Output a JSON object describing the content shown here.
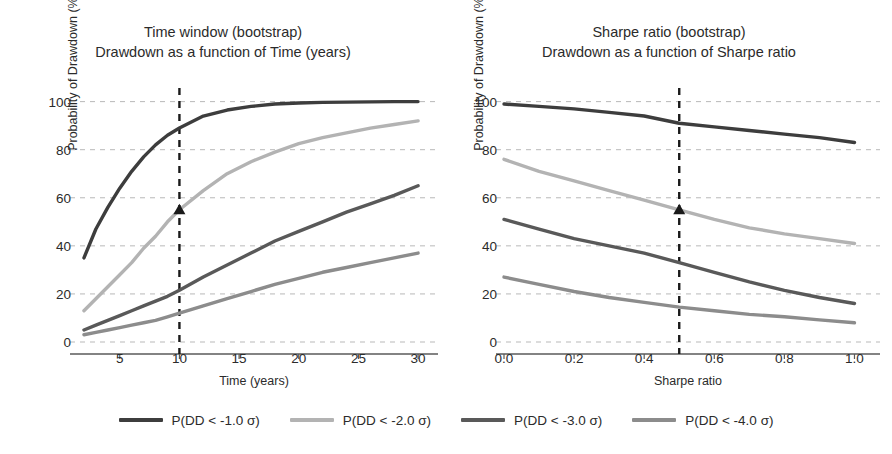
{
  "figure": {
    "width": 892,
    "height": 454,
    "background": "#ffffff"
  },
  "series_colors": [
    "#3d3d3d",
    "#b3b3b3",
    "#595959",
    "#8c8c8c"
  ],
  "legend": {
    "position": "bottom",
    "items": [
      {
        "label": "P(DD < -1.0 σ)",
        "color": "#3d3d3d"
      },
      {
        "label": "P(DD < -2.0 σ)",
        "color": "#b3b3b3"
      },
      {
        "label": "P(DD < -3.0 σ)",
        "color": "#595959"
      },
      {
        "label": "P(DD < -4.0 σ)",
        "color": "#8c8c8c"
      }
    ]
  },
  "panels": {
    "left": {
      "title": "Time window (bootstrap)",
      "subtitle": "Drawdown as a function of Time (years)",
      "xlabel": "Time (years)",
      "ylabel": "Probability of Drawdown (%)",
      "xticks": [
        "5",
        "10",
        "15",
        "20",
        "25",
        "30"
      ],
      "yticks": [
        "0",
        "20",
        "40",
        "60",
        "80",
        "100"
      ],
      "marker_annotation": {
        "x": "10",
        "y": "55"
      }
    },
    "right": {
      "title": "Sharpe ratio (bootstrap)",
      "subtitle": "Drawdown as a function of Sharpe ratio",
      "xlabel": "Sharpe ratio",
      "ylabel": "Probability of Drawdown (%)",
      "xticks": [
        "0.0",
        "0.2",
        "0.4",
        "0.6",
        "0.8",
        "1.0"
      ],
      "yticks": [
        "0",
        "20",
        "40",
        "60",
        "80",
        "100"
      ],
      "marker_annotation": {
        "x": "0.5",
        "y": "55"
      }
    }
  },
  "chart_data": [
    {
      "type": "line",
      "panel": "left",
      "title": "Time window (bootstrap)",
      "subtitle": "Drawdown as a function of Time (years)",
      "xlabel": "Time (years)",
      "ylabel": "Probability of Drawdown (%)",
      "xlim": [
        1.5,
        31
      ],
      "ylim": [
        0,
        104
      ],
      "xticks": [
        5,
        10,
        15,
        20,
        25,
        30
      ],
      "yticks": [
        0,
        20,
        40,
        60,
        80,
        100
      ],
      "grid": true,
      "grid_style": "dashed-horizontal",
      "vline": {
        "x": 10,
        "style": "dashed",
        "color": "#1a1a1a"
      },
      "marker": {
        "x": 10,
        "y": 55,
        "shape": "triangle",
        "color": "#1a1a1a",
        "series": "P(DD < -2.0 σ)"
      },
      "x": [
        2,
        3,
        4,
        5,
        6,
        7,
        8,
        9,
        10,
        12,
        14,
        16,
        18,
        20,
        22,
        24,
        26,
        28,
        30
      ],
      "series": [
        {
          "name": "P(DD < -1.0 σ)",
          "color": "#3d3d3d",
          "values": [
            35,
            47,
            56,
            64,
            71,
            77,
            82,
            86,
            89,
            94,
            96.5,
            98,
            99,
            99.4,
            99.7,
            99.8,
            99.9,
            100,
            100
          ]
        },
        {
          "name": "P(DD < -2.0 σ)",
          "color": "#b3b3b3",
          "values": [
            13,
            18,
            23,
            28,
            33,
            39,
            44,
            50,
            55,
            63,
            70,
            75,
            79,
            82.5,
            85,
            87,
            89,
            90.5,
            92
          ]
        },
        {
          "name": "P(DD < -3.0 σ)",
          "color": "#595959",
          "values": [
            5,
            7,
            9,
            11,
            13,
            15,
            17,
            19,
            21.5,
            27,
            32,
            37,
            42,
            46,
            50,
            54,
            57.5,
            61,
            65
          ]
        },
        {
          "name": "P(DD < -4.0 σ)",
          "color": "#8c8c8c",
          "values": [
            3,
            4,
            5,
            6,
            7,
            8,
            9,
            10.5,
            12,
            15,
            18,
            21,
            24,
            26.5,
            29,
            31,
            33,
            35,
            37
          ]
        }
      ]
    },
    {
      "type": "line",
      "panel": "right",
      "title": "Sharpe ratio (bootstrap)",
      "subtitle": "Drawdown as a function of Sharpe ratio",
      "xlabel": "Sharpe ratio",
      "ylabel": "Probability of Drawdown (%)",
      "xlim": [
        0,
        1.05
      ],
      "ylim": [
        0,
        104
      ],
      "xticks": [
        0.0,
        0.2,
        0.4,
        0.6,
        0.8,
        1.0
      ],
      "yticks": [
        0,
        20,
        40,
        60,
        80,
        100
      ],
      "grid": true,
      "grid_style": "dashed-horizontal",
      "vline": {
        "x": 0.5,
        "style": "dashed",
        "color": "#1a1a1a"
      },
      "marker": {
        "x": 0.5,
        "y": 55,
        "shape": "triangle",
        "color": "#1a1a1a",
        "series": "P(DD < -2.0 σ)"
      },
      "x": [
        0.0,
        0.1,
        0.2,
        0.3,
        0.4,
        0.5,
        0.6,
        0.7,
        0.8,
        0.9,
        1.0
      ],
      "series": [
        {
          "name": "P(DD < -1.0 σ)",
          "color": "#3d3d3d",
          "values": [
            99,
            98,
            97,
            95.5,
            94,
            91,
            89.5,
            88,
            86.5,
            85,
            83
          ]
        },
        {
          "name": "P(DD < -2.0 σ)",
          "color": "#b3b3b3",
          "values": [
            76,
            71,
            67,
            63,
            59,
            55,
            51,
            47.5,
            45,
            43,
            41
          ]
        },
        {
          "name": "P(DD < -3.0 σ)",
          "color": "#595959",
          "values": [
            51,
            47,
            43,
            40,
            37,
            33,
            29,
            25,
            21.5,
            18.5,
            16
          ]
        },
        {
          "name": "P(DD < -4.0 σ)",
          "color": "#8c8c8c",
          "values": [
            27,
            24,
            21,
            18.5,
            16.5,
            14.5,
            13,
            11.5,
            10.5,
            9.2,
            8
          ]
        }
      ]
    }
  ]
}
